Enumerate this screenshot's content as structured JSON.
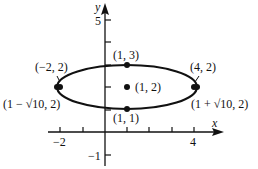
{
  "diagram": {
    "type": "ellipse-graph",
    "axes": {
      "x_label": "x",
      "y_label": "y",
      "x_ticks": [
        {
          "value": -2,
          "label": "−2"
        },
        {
          "value": -1,
          "label": ""
        },
        {
          "value": 1,
          "label": ""
        },
        {
          "value": 2,
          "label": ""
        },
        {
          "value": 3,
          "label": ""
        },
        {
          "value": 4,
          "label": "4"
        }
      ],
      "y_ticks": [
        {
          "value": -1,
          "label": "−1"
        },
        {
          "value": 1,
          "label": ""
        },
        {
          "value": 2,
          "label": ""
        },
        {
          "value": 3,
          "label": ""
        },
        {
          "value": 4,
          "label": ""
        },
        {
          "value": 5,
          "label": "5"
        }
      ]
    },
    "ellipse": {
      "center": [
        1,
        2
      ],
      "semi_major": 3.1623,
      "semi_minor": 1
    },
    "points": [
      {
        "id": "center",
        "label": "(1, 2)"
      },
      {
        "id": "top-vertex",
        "label": "(1, 3)"
      },
      {
        "id": "bottom-vertex",
        "label": "(1, 1)"
      },
      {
        "id": "left-focus",
        "label": "(−2, 2)"
      },
      {
        "id": "right-focus",
        "label": "(4, 2)"
      },
      {
        "id": "left-vertex",
        "label": "(1 − √10, 2)"
      },
      {
        "id": "right-vertex",
        "label": "(1 + √10, 2)"
      }
    ],
    "colors": {
      "stroke": "#111111",
      "background": "#ffffff"
    }
  }
}
